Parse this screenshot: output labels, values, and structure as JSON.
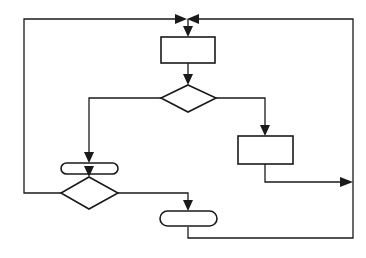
{
  "diagram": {
    "type": "flowchart",
    "colors": {
      "stroke": "#1a1a1a",
      "background": "#ffffff"
    },
    "nodes": [
      {
        "id": "process-1",
        "shape": "rectangle",
        "label": ""
      },
      {
        "id": "decision-1",
        "shape": "diamond",
        "label": ""
      },
      {
        "id": "terminal-1",
        "shape": "rounded-rectangle",
        "label": ""
      },
      {
        "id": "process-2",
        "shape": "rectangle",
        "label": ""
      },
      {
        "id": "decision-2",
        "shape": "diamond",
        "label": ""
      },
      {
        "id": "terminal-2",
        "shape": "rounded-rectangle",
        "label": ""
      }
    ],
    "edges": [
      {
        "from": "merge-top",
        "to": "process-1"
      },
      {
        "from": "process-1",
        "to": "decision-1"
      },
      {
        "from": "decision-1",
        "to": "terminal-1",
        "side": "left"
      },
      {
        "from": "decision-1",
        "to": "process-2",
        "side": "right"
      },
      {
        "from": "terminal-1",
        "to": "decision-2"
      },
      {
        "from": "decision-2",
        "to": "merge-top",
        "side": "left",
        "route": "loop-back-left"
      },
      {
        "from": "decision-2",
        "to": "terminal-2",
        "side": "right"
      },
      {
        "from": "process-2",
        "to": "right-rail",
        "route": "join-right"
      },
      {
        "from": "terminal-2",
        "to": "merge-top",
        "route": "loop-back-right"
      }
    ]
  }
}
